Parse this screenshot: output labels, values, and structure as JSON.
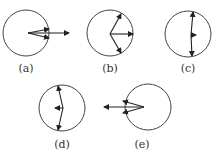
{
  "panels": [
    {
      "id": "a",
      "label": "(a)",
      "description": "two vectors from center to circle edge, close together, plus resultant arrow pointing right outside circle"
    },
    {
      "id": "b",
      "label": "(b)",
      "description": "three vectors from center: up-right, right, down-right to circle edge"
    },
    {
      "id": "c",
      "label": "(c)",
      "description": "two vectors from center: up and down to circle edge, small resultant pointing right"
    },
    {
      "id": "d",
      "label": "(d)",
      "description": "two vectors from center: up and down to circle edge, small resultant pointing left"
    },
    {
      "id": "e",
      "label": "(e)",
      "description": "two vectors from center to left edge, close together, plus resultant arrow pointing left outside circle"
    }
  ]
}
